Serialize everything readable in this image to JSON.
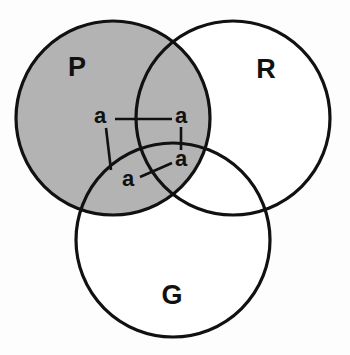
{
  "figure": {
    "type": "venn-diagram",
    "background_color": "#fdfdfd",
    "outline_color": "#111111",
    "shaded_fill_color": "#b3b3b3",
    "unshaded_fill_color": "#ffffff"
  },
  "sets": [
    {
      "id": "P",
      "label": "P",
      "shaded": true,
      "fill": "#b3b3b3",
      "center_x": 113,
      "center_y": 118,
      "radius": 97,
      "label_x": 77,
      "label_y": 76
    },
    {
      "id": "R",
      "label": "R",
      "shaded": false,
      "fill": "#ffffff",
      "center_x": 233,
      "center_y": 118,
      "radius": 97,
      "label_x": 266,
      "label_y": 78
    },
    {
      "id": "G",
      "label": "G",
      "shaded": false,
      "fill": "#ffffff",
      "center_x": 173,
      "center_y": 240,
      "radius": 97,
      "label_x": 172,
      "label_y": 304
    }
  ],
  "region_labels": [
    {
      "id": "a-p-only",
      "label": "a",
      "region": "P only",
      "text_x": 100,
      "text_y": 123,
      "leader": {
        "x1": 115,
        "y1": 119,
        "x2": 172,
        "y2": 119
      }
    },
    {
      "id": "a-p-and-r",
      "label": "a",
      "region": "P and R",
      "text_x": 175,
      "text_y": 123,
      "leader": {
        "x1": 181,
        "y1": 127,
        "x2": 181,
        "y2": 150
      }
    },
    {
      "id": "a-p-and-r-and-g",
      "label": "a",
      "region": "P and R and G",
      "text_x": 175,
      "text_y": 165,
      "leader": {
        "x1": 172,
        "y1": 163,
        "x2": 140,
        "y2": 177
      }
    },
    {
      "id": "a-p-and-g",
      "label": "a",
      "region": "P and G",
      "text_x": 124,
      "text_y": 185,
      "leader": {
        "x1": 111,
        "y1": 170,
        "x2": 106,
        "y2": 128
      }
    }
  ]
}
